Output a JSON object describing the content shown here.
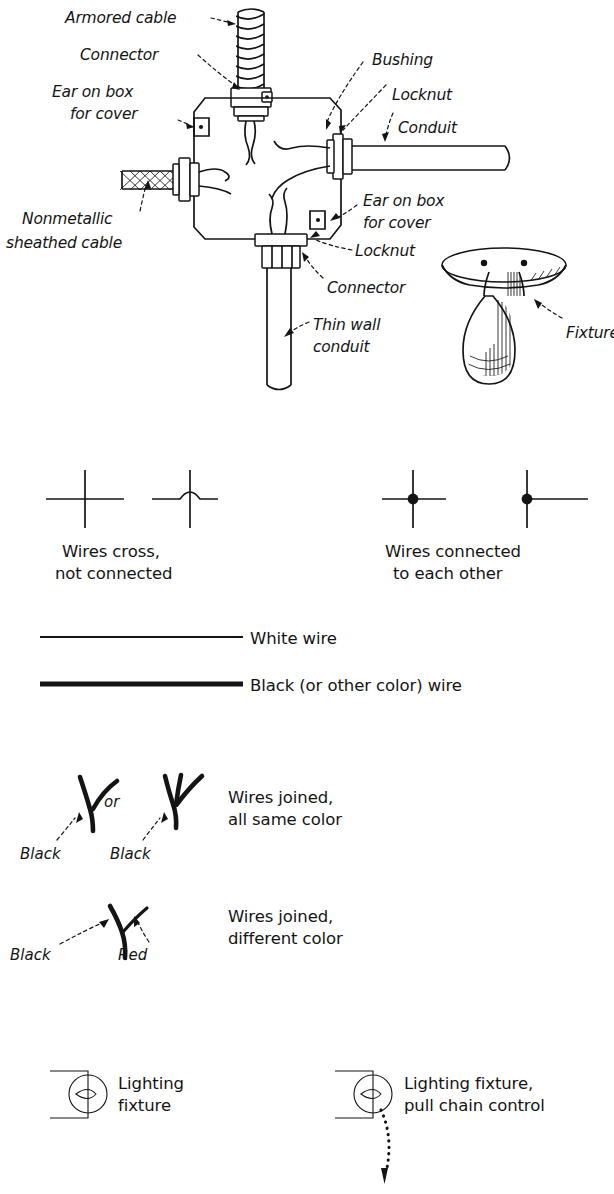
{
  "figure": {
    "kind": "electrical-wiring-reference-plate",
    "background_color": "#ffffff",
    "ink_color": "#141414"
  },
  "junction_box_diagram": {
    "name": "outlet-box-connections",
    "labels": [
      {
        "id": "armored-cable",
        "text": "Armored cable"
      },
      {
        "id": "connector-top",
        "text": "Connector"
      },
      {
        "id": "ear-on-box-left",
        "line1": "Ear on box",
        "line2": "for cover"
      },
      {
        "id": "bushing",
        "text": "Bushing"
      },
      {
        "id": "locknut-right",
        "text": "Locknut"
      },
      {
        "id": "conduit",
        "text": "Conduit"
      },
      {
        "id": "ear-on-box-right",
        "line1": "Ear on box",
        "line2": "for cover"
      },
      {
        "id": "nonmetallic-cable",
        "line1": "Nonmetallic",
        "line2": "sheathed cable"
      },
      {
        "id": "locknut-bottom",
        "text": "Locknut"
      },
      {
        "id": "connector-bottom",
        "text": "Connector"
      },
      {
        "id": "thin-wall-conduit",
        "line1": "Thin wall",
        "line2": "conduit"
      },
      {
        "id": "fixture",
        "text": "Fixture"
      }
    ]
  },
  "symbol_legend": {
    "crossing": {
      "caption_line1": "Wires cross,",
      "caption_line2": "not connected",
      "variants": [
        "plain-crossover",
        "hop-crossover"
      ]
    },
    "connected": {
      "caption_line1": "Wires connected",
      "caption_line2": "to each other",
      "variants": [
        "four-way-dot",
        "tee-dot"
      ]
    },
    "wire_types": [
      {
        "id": "white-wire",
        "label": "White wire",
        "stroke_width": 1.7
      },
      {
        "id": "black-wire",
        "label": "Black (or other color) wire",
        "stroke_width": 4.6
      }
    ],
    "splices": [
      {
        "id": "same-color-splice",
        "caption_line1": "Wires joined,",
        "caption_line2": "all same color",
        "conjunction": "or",
        "leg_labels": [
          "Black",
          "Black"
        ]
      },
      {
        "id": "different-color-splice",
        "caption_line1": "Wires joined,",
        "caption_line2": "different color",
        "leg_labels": [
          "Black",
          "Red"
        ]
      }
    ],
    "fixtures": [
      {
        "id": "lighting-fixture",
        "caption_line1": "Lighting",
        "caption_line2": "fixture",
        "has_pull_chain": false
      },
      {
        "id": "lighting-fixture-pull-chain",
        "caption_line1": "Lighting fixture,",
        "caption_line2": "pull chain control",
        "has_pull_chain": true
      }
    ]
  }
}
